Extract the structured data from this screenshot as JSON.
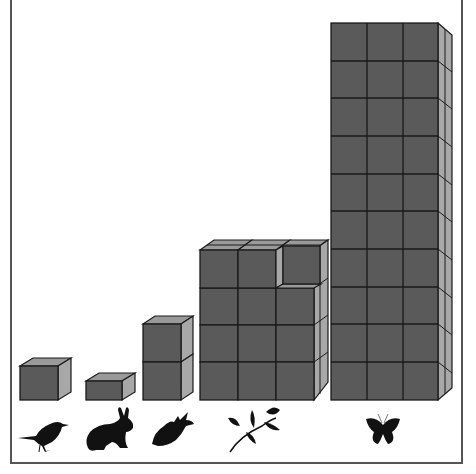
{
  "figure": {
    "colors": {
      "cube_front": "#5a5a5a",
      "cube_side": "#a8a8a8",
      "cube_top": "#9a9a9a",
      "border": "#555555",
      "icon": "#111111"
    }
  },
  "stacks": [
    {
      "organism": "bird",
      "icon": "bird-icon",
      "cubes_wide": 1,
      "cubes_high": 1,
      "note": "single cube"
    },
    {
      "organism": "rabbit",
      "icon": "rabbit-icon",
      "cubes_wide": 1,
      "cubes_high": 0.5,
      "note": "half-height block"
    },
    {
      "organism": "fish",
      "icon": "fish-icon",
      "cubes_wide": 1,
      "cubes_high": 2,
      "note": "two stacked cubes"
    },
    {
      "organism": "plant",
      "icon": "plant-branch-icon",
      "cubes_wide": 3,
      "cubes_high": 4,
      "note": "3x4 front face, top-right cube recessed"
    },
    {
      "organism": "butterfly",
      "icon": "butterfly-icon",
      "cubes_wide": 3,
      "cubes_high": 10,
      "note": "3x10 tall column"
    }
  ]
}
